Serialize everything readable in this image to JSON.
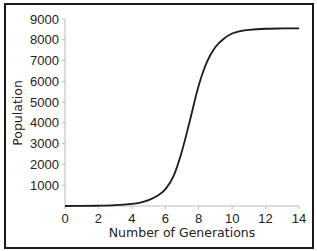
{
  "chart_data": {
    "type": "line",
    "title": "",
    "xlabel": "Number of Generations",
    "ylabel": "Population",
    "xlim": [
      0,
      14
    ],
    "ylim": [
      0,
      9000
    ],
    "x_ticks": [
      0,
      2,
      4,
      6,
      8,
      10,
      12,
      14
    ],
    "y_ticks": [
      1000,
      2000,
      3000,
      4000,
      5000,
      6000,
      7000,
      8000,
      9000
    ],
    "grid": false,
    "legend": null,
    "series": [
      {
        "name": "Population",
        "color": "#1a1a1a",
        "x": [
          0,
          1,
          2,
          3,
          4,
          4.5,
          5,
          5.5,
          6,
          6.5,
          7,
          7.5,
          8,
          8.5,
          9,
          9.5,
          10,
          10.5,
          11,
          12,
          13,
          14
        ],
        "values": [
          0,
          5,
          15,
          40,
          100,
          160,
          280,
          480,
          800,
          1450,
          2650,
          4200,
          5800,
          6950,
          7650,
          8050,
          8300,
          8420,
          8480,
          8530,
          8545,
          8550
        ]
      }
    ]
  }
}
